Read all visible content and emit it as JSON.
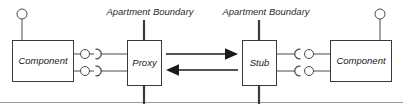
{
  "diagram": {
    "type": "uml-component-diagram",
    "colors": {
      "background": "#ffffff",
      "box_stroke": "#3b3b3b",
      "wire_stroke": "#4a4a4a",
      "boundary_stroke": "#3b3b3b",
      "arrow_fill": "#1a1a1a",
      "text": "#1a1a1a",
      "frame_rule": "#9a9a9a"
    },
    "boxes": {
      "left_component": {
        "label": "Component",
        "x": 12,
        "y": 40,
        "w": 61,
        "h": 41
      },
      "proxy": {
        "label": "Proxy",
        "x": 127,
        "y": 40,
        "w": 34,
        "h": 45
      },
      "stub": {
        "label": "Stub",
        "x": 242,
        "y": 40,
        "w": 34,
        "h": 45
      },
      "right_component": {
        "label": "Component",
        "x": 330,
        "y": 40,
        "w": 61,
        "h": 41
      }
    },
    "boundaries": [
      {
        "label": "Apartment Boundary",
        "label_x": 150,
        "label_y": 15,
        "line_x": 144,
        "line_top": 20,
        "line_bottom": 104
      },
      {
        "label": "Apartment Boundary",
        "label_x": 266,
        "label_y": 15,
        "line_x": 259,
        "line_top": 20,
        "line_bottom": 104
      }
    ],
    "interfaces": {
      "left_component_top": {
        "kind": "provided-lollipop",
        "cx": 22,
        "cy": 14,
        "r": 5
      },
      "right_component_top": {
        "kind": "provided-lollipop",
        "cx": 380,
        "cy": 14,
        "r": 5
      },
      "left_pair_upper": {
        "kind": "provided-lollipop",
        "cx": 85,
        "cy": 54,
        "r": 4.5
      },
      "left_pair_lower": {
        "kind": "provided-lollipop",
        "cx": 85,
        "cy": 71,
        "r": 4.5
      },
      "left_socket_upper": {
        "kind": "required-socket",
        "cx": 98,
        "cy": 54,
        "opens": "right"
      },
      "left_socket_lower": {
        "kind": "required-socket",
        "cx": 98,
        "cy": 71,
        "opens": "right"
      },
      "right_socket_upper": {
        "kind": "required-socket",
        "cx": 298,
        "cy": 54,
        "opens": "left"
      },
      "right_socket_lower": {
        "kind": "required-socket",
        "cx": 298,
        "cy": 71,
        "opens": "left"
      },
      "right_pair_upper": {
        "kind": "provided-lollipop",
        "cx": 310,
        "cy": 54,
        "r": 4.5
      },
      "right_pair_lower": {
        "kind": "provided-lollipop",
        "cx": 310,
        "cy": 71,
        "r": 4.5
      }
    },
    "call_arrows": [
      {
        "name": "proxy-to-stub",
        "direction": "right",
        "x1": 166,
        "x2": 238,
        "y": 54
      },
      {
        "name": "stub-to-proxy",
        "direction": "left",
        "x1": 238,
        "x2": 166,
        "y": 70
      }
    ],
    "connector_lines": [
      {
        "name": "left-component-upper-wire",
        "x1": 73,
        "x2": 80,
        "y": 54
      },
      {
        "name": "left-component-lower-wire",
        "x1": 73,
        "x2": 80,
        "y": 71
      },
      {
        "name": "left-socket-upper-wire",
        "x1": 103,
        "x2": 127,
        "y": 54
      },
      {
        "name": "left-socket-lower-wire",
        "x1": 103,
        "x2": 127,
        "y": 71
      },
      {
        "name": "stub-upper-wire",
        "x1": 276,
        "x2": 294,
        "y": 54
      },
      {
        "name": "stub-lower-wire",
        "x1": 276,
        "x2": 294,
        "y": 71
      },
      {
        "name": "right-component-upper-wire",
        "x1": 315,
        "x2": 330,
        "y": 54
      },
      {
        "name": "right-component-lower-wire",
        "x1": 315,
        "x2": 330,
        "y": 71
      },
      {
        "name": "left-top-lollipop-stem",
        "x1": 22,
        "x2": 22,
        "y1": 19,
        "y2": 40
      },
      {
        "name": "right-top-lollipop-stem",
        "x1": 380,
        "x2": 380,
        "y1": 19,
        "y2": 40
      }
    ],
    "frame": {
      "bottom_rule_y": 102,
      "bottom_rule_x1": 0,
      "bottom_rule_x2": 403
    }
  }
}
